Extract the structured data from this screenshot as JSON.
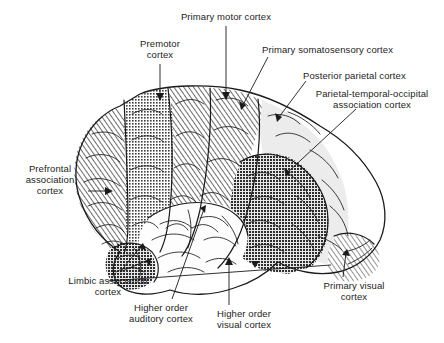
{
  "figure": {
    "background_color": "#ffffff",
    "ink_color": "#1a1a1a"
  },
  "labels": [
    {
      "id": "primary-motor-cortex",
      "text": "Primary motor cortex",
      "align": "center",
      "x": 165,
      "y": 11,
      "width": 122
    },
    {
      "id": "premotor-cortex",
      "text": "Premotor\ncortex",
      "align": "center",
      "x": 120,
      "y": 38,
      "width": 80
    },
    {
      "id": "primary-somatosensory-cortex",
      "text": "Primary somatosensory cortex",
      "align": "left",
      "x": 262,
      "y": 44,
      "width": 172
    },
    {
      "id": "posterior-parietal-cortex",
      "text": "Posterior parietal cortex",
      "align": "left",
      "x": 303,
      "y": 70,
      "width": 138
    },
    {
      "id": "parietal-temporal-occipital-association-cortex",
      "text": "Parietal-temporal-occipital\nassociation cortex",
      "align": "center",
      "x": 300,
      "y": 88,
      "width": 144
    },
    {
      "id": "prefrontal-association-cortex",
      "text": "Prefrontal\nassociation\ncortex",
      "align": "center",
      "x": 12,
      "y": 163,
      "width": 76
    },
    {
      "id": "limbic-association-cortex",
      "text": "Limbic association\ncortex",
      "align": "center",
      "x": 52,
      "y": 275,
      "width": 112
    },
    {
      "id": "higher-order-auditory-cortex",
      "text": "Higher order\nauditory cortex",
      "align": "center",
      "x": 115,
      "y": 302,
      "width": 92
    },
    {
      "id": "higher-order-visual-cortex",
      "text": "Higher order\nvisual cortex",
      "align": "center",
      "x": 201,
      "y": 308,
      "width": 86
    },
    {
      "id": "primary-visual-cortex",
      "text": "Primary visual\ncortex",
      "align": "center",
      "x": 308,
      "y": 280,
      "width": 92
    }
  ],
  "regions": [
    {
      "id": "prefrontal-association-cortex",
      "label": "Prefrontal association cortex",
      "fill": "diagonal-hatch",
      "tone": "medium"
    },
    {
      "id": "premotor-cortex",
      "label": "Premotor cortex",
      "fill": "stipple",
      "tone": "medium-dark"
    },
    {
      "id": "primary-motor-cortex",
      "label": "Primary motor cortex",
      "fill": "diagonal-hatch",
      "tone": "medium"
    },
    {
      "id": "primary-somatosensory-cortex",
      "label": "Primary somatosensory cortex",
      "fill": "diagonal-hatch",
      "tone": "medium"
    },
    {
      "id": "posterior-parietal-cortex",
      "label": "Posterior parietal cortex",
      "fill": "plain-light",
      "tone": "light"
    },
    {
      "id": "parietal-temporal-occipital-association-cortex",
      "label": "Parietal-temporal-occipital association cortex",
      "fill": "stipple",
      "tone": "dark"
    },
    {
      "id": "primary-visual-cortex",
      "label": "Primary visual cortex",
      "fill": "diagonal-hatch",
      "tone": "medium"
    },
    {
      "id": "higher-order-visual-cortex",
      "label": "Higher order visual cortex",
      "fill": "plain-white",
      "tone": "white"
    },
    {
      "id": "higher-order-auditory-cortex",
      "label": "Higher order auditory cortex",
      "fill": "plain-white",
      "tone": "white"
    },
    {
      "id": "limbic-association-cortex",
      "label": "Limbic association cortex",
      "fill": "stipple",
      "tone": "dark"
    }
  ]
}
